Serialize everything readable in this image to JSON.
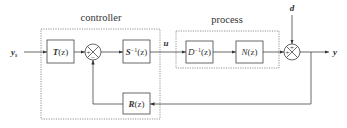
{
  "groups": {
    "controller": "controller",
    "process": "process"
  },
  "blocks": {
    "T": {
      "name": "T",
      "arg": "(z)"
    },
    "S_inv": {
      "name": "S",
      "sup": "−1",
      "arg": "(z)"
    },
    "R": {
      "name": "R",
      "arg": "(z)"
    },
    "D_inv": {
      "name": "D",
      "sup": "−1",
      "arg": "(z)"
    },
    "N": {
      "name": "N",
      "arg": "(z)"
    }
  },
  "signals": {
    "input": "y",
    "input_sub": "s",
    "control": "u",
    "disturbance": "d",
    "output": "y"
  },
  "sums": {
    "controller_sum": {
      "left": "+",
      "bottom": "−"
    },
    "output_sum": {
      "left": "+",
      "top": "+"
    }
  }
}
